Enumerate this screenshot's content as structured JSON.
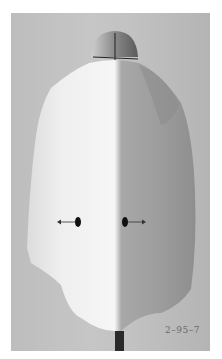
{
  "photo": {
    "subject": "garment on dress form, back view",
    "caption": "2–95–7",
    "colors": {
      "background": "#c0c0c0",
      "fabric_light": "#eeeeee",
      "fabric_shadow": "#9a9a9a",
      "marker": "#111111"
    },
    "annotations": [
      {
        "type": "dot-with-arrow",
        "direction": "left"
      },
      {
        "type": "dot-with-arrow",
        "direction": "right"
      }
    ]
  }
}
